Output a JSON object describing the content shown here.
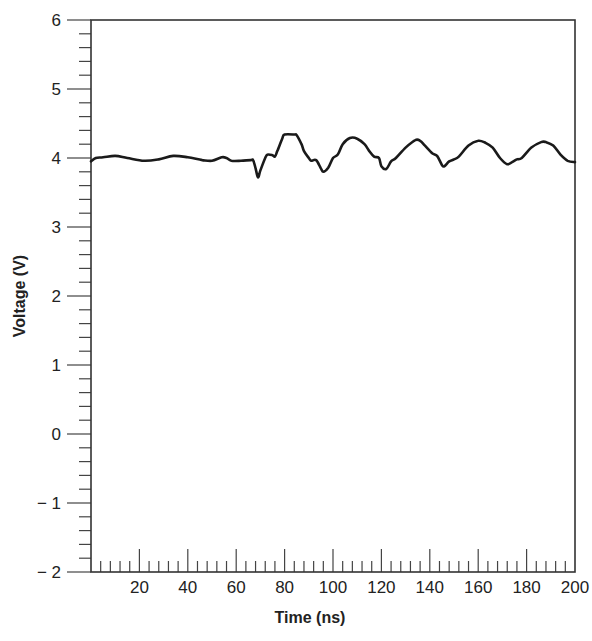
{
  "chart_data": {
    "type": "line",
    "title": "",
    "xlabel": "Time (ns)",
    "ylabel": "Voltage (V)",
    "xlim": [
      0,
      200
    ],
    "ylim": [
      -2,
      6
    ],
    "x_ticks": [
      20,
      40,
      60,
      80,
      100,
      120,
      140,
      160,
      180,
      200
    ],
    "x_tick_labels": [
      "20",
      "40",
      "60",
      "80",
      "100",
      "120",
      "140",
      "160",
      "180",
      "200"
    ],
    "x_minor_step": 4,
    "y_ticks": [
      -2,
      -1,
      0,
      1,
      2,
      3,
      4,
      5,
      6
    ],
    "y_tick_labels": [
      "− 2",
      "− 1",
      "0",
      "1",
      "2",
      "3",
      "4",
      "5",
      "6"
    ],
    "y_minor_step": 0.2,
    "grid": false,
    "legend": null,
    "series": [
      {
        "name": "Voltage",
        "color": "#1a1a1a",
        "x": [
          0,
          2,
          5,
          10,
          15,
          22,
          28,
          34,
          40,
          46,
          50,
          54,
          56,
          58,
          62,
          66,
          67,
          68,
          69,
          70,
          72,
          73,
          75,
          76,
          77,
          79,
          80,
          84,
          85,
          87,
          88,
          90,
          91,
          93,
          95,
          96,
          98,
          100,
          102,
          104,
          107,
          110,
          113,
          115,
          117,
          119,
          120,
          122,
          124,
          126,
          130,
          134,
          136,
          138,
          141,
          143,
          145,
          146,
          148,
          150,
          152,
          156,
          160,
          163,
          166,
          169,
          172,
          174,
          176,
          178,
          182,
          186,
          188,
          191,
          194,
          197,
          200
        ],
        "y": [
          3.95,
          4.0,
          4.01,
          4.03,
          4.0,
          3.96,
          3.98,
          4.03,
          4.01,
          3.97,
          3.96,
          4.01,
          4.0,
          3.96,
          3.96,
          3.97,
          3.97,
          3.85,
          3.72,
          3.82,
          4.0,
          4.05,
          4.04,
          4.02,
          4.1,
          4.28,
          4.34,
          4.34,
          4.33,
          4.2,
          4.1,
          4.0,
          3.96,
          3.97,
          3.85,
          3.8,
          3.86,
          4.0,
          4.05,
          4.2,
          4.29,
          4.28,
          4.2,
          4.1,
          4.02,
          4.0,
          3.88,
          3.84,
          3.95,
          4.0,
          4.15,
          4.26,
          4.25,
          4.18,
          4.07,
          4.03,
          3.9,
          3.88,
          3.95,
          3.98,
          4.02,
          4.18,
          4.25,
          4.22,
          4.15,
          4.0,
          3.91,
          3.94,
          3.98,
          4.0,
          4.15,
          4.23,
          4.23,
          4.18,
          4.05,
          3.96,
          3.94
        ]
      }
    ]
  }
}
